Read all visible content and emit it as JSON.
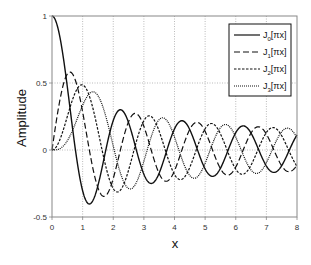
{
  "chart_data": {
    "type": "line",
    "title": "",
    "xlabel": "x",
    "ylabel": "Amplitude",
    "xlim": [
      0,
      8
    ],
    "ylim": [
      -0.5,
      1
    ],
    "xticks": [
      "0",
      "1",
      "2",
      "3",
      "4",
      "5",
      "6",
      "7",
      "8"
    ],
    "yticks": [
      "-0.5",
      "0",
      "0.5",
      "1"
    ],
    "grid": true,
    "legend_position": "upper right",
    "series": [
      {
        "name": "J0[πx]",
        "order": 0,
        "dash": "",
        "legend_base": "J",
        "legend_sub": "0",
        "legend_arg": "[πx]"
      },
      {
        "name": "J1[πx]",
        "order": 1,
        "dash": "6,3",
        "legend_base": "J",
        "legend_sub": "1",
        "legend_arg": "[πx]"
      },
      {
        "name": "J2[πx]",
        "order": 2,
        "dash": "2.5,1.5",
        "legend_base": "J",
        "legend_sub": "2",
        "legend_arg": "[πx]"
      },
      {
        "name": "J3[πx]",
        "order": 3,
        "dash": "1,1",
        "legend_base": "J",
        "legend_sub": "3",
        "legend_arg": "[πx]"
      }
    ],
    "sample_points": {
      "x": [
        0,
        0.5,
        1,
        1.5,
        2,
        2.5,
        3,
        3.5,
        4,
        5,
        6,
        7,
        8
      ],
      "J0": [
        1.0,
        0.472,
        -0.304,
        -0.336,
        0.22,
        0.23,
        -0.171,
        -0.187,
        0.147,
        -0.132,
        0.12,
        -0.111,
        0.104
      ],
      "J1": [
        0.0,
        0.567,
        0.285,
        -0.257,
        -0.209,
        0.188,
        0.171,
        -0.158,
        -0.147,
        0.136,
        -0.123,
        0.113,
        -0.105
      ],
      "J2": [
        0.0,
        0.249,
        0.485,
        -0.001,
        -0.287,
        0.008,
        0.226,
        -0.005,
        -0.19,
        -0.167,
        -0.149,
        -0.135,
        -0.123
      ],
      "J3": [
        0.0,
        0.069,
        0.334,
        0.327,
        -0.049,
        -0.29,
        -0.025,
        0.234,
        0.02,
        -0.18,
        0.002,
        0.162,
        0.012
      ]
    },
    "peak_annotations": {
      "J1_max": {
        "x": 0.586,
        "y": 0.582
      },
      "J2_max": {
        "x": 0.972,
        "y": 0.486
      },
      "J3_max": {
        "x": 1.347,
        "y": 0.434
      },
      "J0_min": {
        "x": 1.22,
        "y": -0.403
      }
    }
  }
}
